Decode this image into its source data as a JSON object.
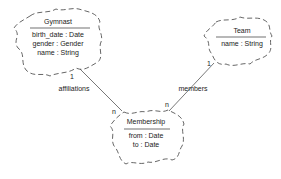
{
  "diagram": {
    "type": "class-association",
    "classes": [
      {
        "name": "Gymnast",
        "attributes": [
          "birth_date : Date",
          "gender : Gender",
          "name : String"
        ]
      },
      {
        "name": "Team",
        "attributes": [
          "name : String"
        ]
      },
      {
        "name": "Membership",
        "attributes": [
          "from : Date",
          "to : Date"
        ]
      }
    ],
    "associations": [
      {
        "label": "affiliations",
        "from": "Gymnast",
        "to": "Membership",
        "from_cardinality": "1",
        "to_cardinality": "n"
      },
      {
        "label": "members",
        "from": "Team",
        "to": "Membership",
        "from_cardinality": "1",
        "to_cardinality": "n"
      }
    ],
    "colors": {
      "line": "#555555",
      "text": "#222222",
      "background": "#ffffff"
    }
  }
}
